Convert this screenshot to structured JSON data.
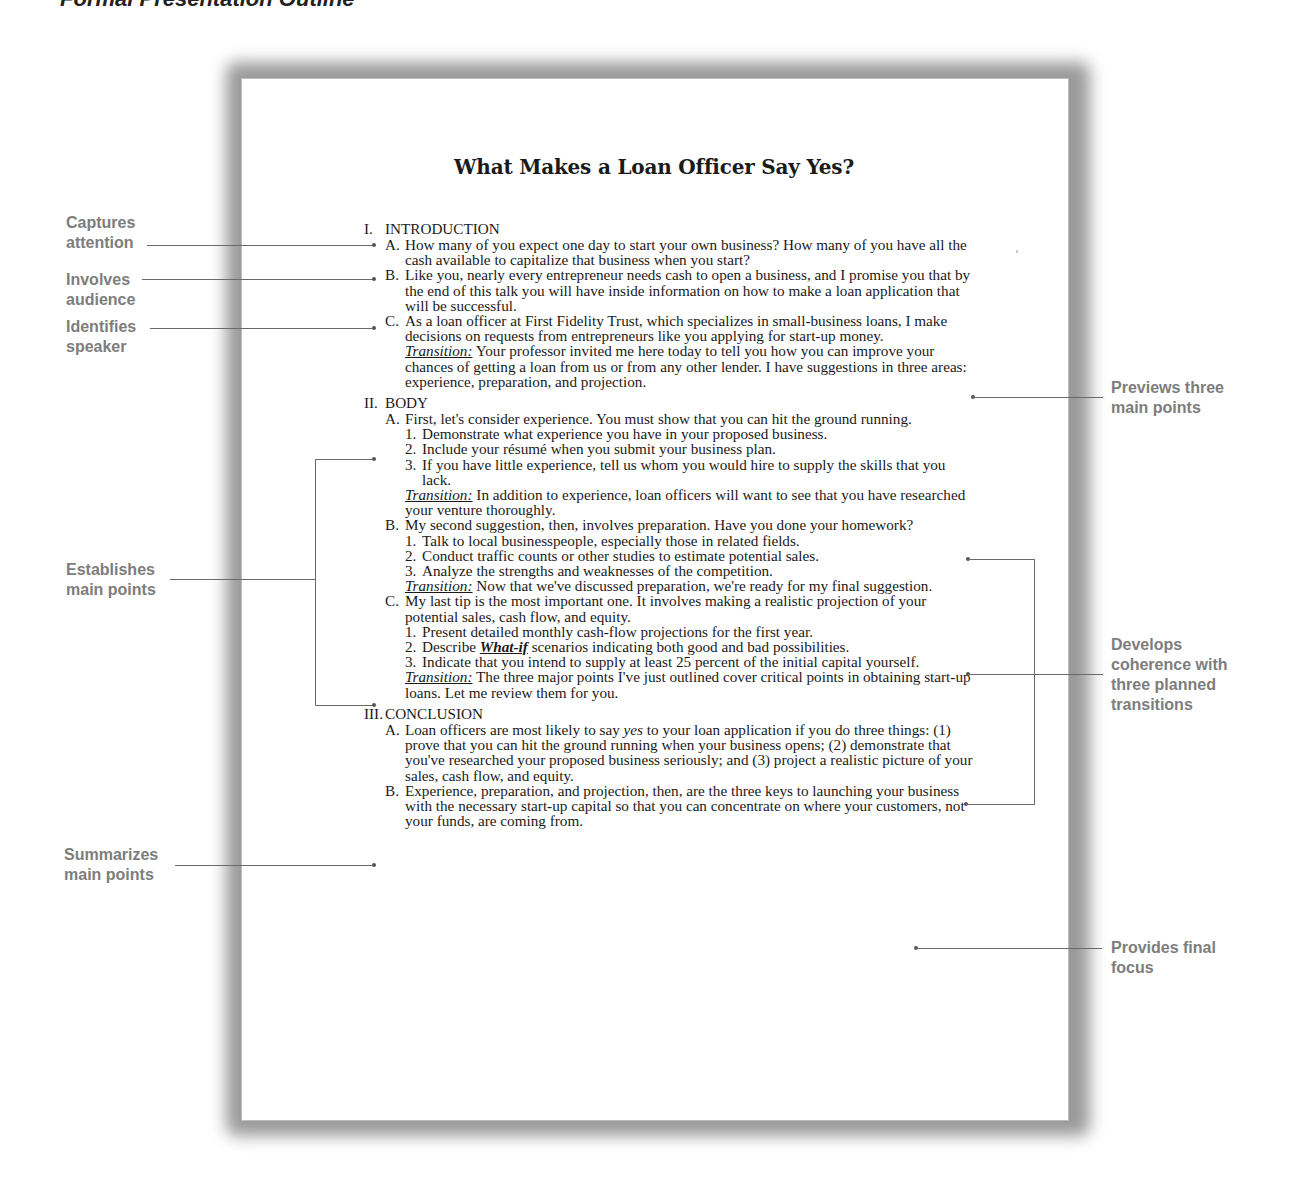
{
  "figure": {
    "heading": "Formal Presentation Outline"
  },
  "document": {
    "title": "What Makes a Loan Officer Say Yes?",
    "transition_label": "Transition:",
    "sections": [
      {
        "numeral": "I.",
        "title": "INTRODUCTION",
        "items": [
          {
            "letter": "A.",
            "text": "How many of you expect one day to start your own business? How many of you have all the cash available to capitalize that business when you start?"
          },
          {
            "letter": "B.",
            "text": "Like you, nearly every entrepreneur needs cash to open a business, and I promise you that by the end of this talk you will have inside information on how to make a loan application that will be successful."
          },
          {
            "letter": "C.",
            "text": "As a loan officer at First Fidelity Trust, which specializes in small-business loans, I make decisions on requests from entrepreneurs like you applying for start-up money.",
            "transition": "Your professor invited me here today to tell you how you can improve your chances of getting a loan from us or from any other lender. I have suggestions in three areas: experience, preparation, and projection."
          }
        ]
      },
      {
        "numeral": "II.",
        "title": "BODY",
        "items": [
          {
            "letter": "A.",
            "text": "First, let's consider experience. You must show that you can hit the ground running.",
            "subpoints": [
              {
                "num": "1.",
                "text": "Demonstrate what experience you have in your proposed business."
              },
              {
                "num": "2.",
                "text": "Include your résumé when you submit your business plan."
              },
              {
                "num": "3.",
                "text": "If you have little experience, tell us whom you would hire to supply the skills that you lack."
              }
            ],
            "transition": "In addition to experience, loan officers will want to see that you have researched your venture thoroughly."
          },
          {
            "letter": "B.",
            "text": "My second suggestion, then, involves preparation. Have you done your homework?",
            "subpoints": [
              {
                "num": "1.",
                "text": "Talk to local businesspeople, especially those in related fields."
              },
              {
                "num": "2.",
                "text": "Conduct traffic counts or other studies to estimate potential sales."
              },
              {
                "num": "3.",
                "text": "Analyze the strengths and weaknesses of the competition."
              }
            ],
            "transition": "Now that we've discussed preparation, we're ready for my final suggestion."
          },
          {
            "letter": "C.",
            "text": "My last tip is the most important one. It involves making a realistic projection of your potential sales, cash flow, and equity.",
            "subpoints": [
              {
                "num": "1.",
                "text": "Present detailed monthly cash-flow projections for the first year."
              },
              {
                "num": "2.",
                "pre": "Describe ",
                "emph": "What-if",
                "post": " scenarios indicating both good and bad possibilities."
              },
              {
                "num": "3.",
                "text": "Indicate that you intend to supply at least 25 percent of the initial capital yourself."
              }
            ],
            "transition": "The three major points I've just outlined cover critical points in obtaining start-up loans. Let me review them for you."
          }
        ]
      },
      {
        "numeral": "III.",
        "title": "CONCLUSION",
        "items": [
          {
            "letter": "A.",
            "pre": "Loan officers are most likely to say ",
            "emph": "yes",
            "post": " to your loan application if you do three things: (1) prove that you can hit the ground running when your business opens; (2) demonstrate that you've researched your proposed business seriously; and (3) project a realistic picture of your sales, cash flow, and equity."
          },
          {
            "letter": "B.",
            "text": "Experience, preparation, and projection, then, are the three keys to launching your business with the necessary start-up capital so that you can concentrate on where your customers, not your funds, are coming from."
          }
        ]
      }
    ]
  },
  "annotations": {
    "left": [
      {
        "line1": "Captures",
        "line2": "attention"
      },
      {
        "line1": "Involves",
        "line2": "audience"
      },
      {
        "line1": "Identifies",
        "line2": "speaker"
      },
      {
        "line1": "Establishes",
        "line2": "main points"
      },
      {
        "line1": "Summarizes",
        "line2": "main points"
      }
    ],
    "right": [
      {
        "line1": "Previews three",
        "line2": "main points"
      },
      {
        "line1": "Develops",
        "line2": "coherence with",
        "line3": "three planned",
        "line4": "transitions"
      },
      {
        "line1": "Provides final",
        "line2": "focus"
      }
    ]
  },
  "colors": {
    "annotation_text": "#7d7d7d",
    "leader_line": "#6a6a6a",
    "body_text": "#1a1a1a",
    "page_shadow": "#9a9a9a"
  }
}
